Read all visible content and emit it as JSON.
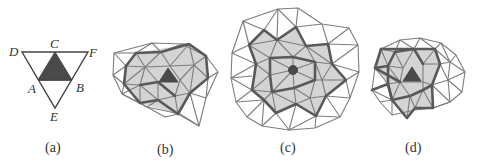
{
  "figure": {
    "panels": [
      {
        "id": "a",
        "caption": "(a)",
        "description": "Single triangle subdivided; center triangle shaded dark",
        "vertex_labels": {
          "C": "C",
          "D": "D",
          "F": "F",
          "A": "A",
          "B": "B",
          "E": "E"
        }
      },
      {
        "id": "b",
        "caption": "(b)",
        "description": "Triangle mesh, one ring of neighbors shaded gray around dark central triangle, thick boundary"
      },
      {
        "id": "c",
        "caption": "(c)",
        "description": "Larger triangle mesh, shaded region around central vertex (dark dot), thick star-shaped boundary"
      },
      {
        "id": "d",
        "caption": "(d)",
        "description": "Triangle mesh, shaded region around dark central triangle, thick jagged boundary"
      }
    ],
    "colors": {
      "mesh_line": "#7d7d7d",
      "boundary_line": "#595959",
      "shaded_region": "#d4d4d4",
      "center_fill": "#4a4a4a"
    }
  }
}
